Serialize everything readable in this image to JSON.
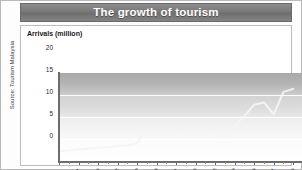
{
  "title": "The growth of tourism",
  "source_note": "Source: Tourism Malaysia",
  "chart_data": {
    "type": "line",
    "title": "The growth of tourism",
    "xlabel": "",
    "ylabel": "Arrivals (million)",
    "ylim": [
      0,
      20
    ],
    "xlim": [
      1981,
      2006
    ],
    "yticks": [
      "0",
      "5",
      "10",
      "15",
      "20"
    ],
    "ytick_values": [
      0,
      5,
      10,
      15,
      20
    ],
    "grid": true,
    "gridlines_at": [
      5,
      10,
      15
    ],
    "legend": "none",
    "xtick_labels": [
      "1981",
      "1983",
      "1985",
      "1987",
      "1989",
      "1991",
      "1993",
      "1995",
      "1997",
      "1999",
      "2001",
      "2003",
      "2005"
    ],
    "x": [
      1981,
      1982,
      1983,
      1984,
      1985,
      1986,
      1987,
      1988,
      1989,
      1990,
      1991,
      1992,
      1993,
      1994,
      1995,
      1996,
      1997,
      1998,
      1999,
      2000,
      2001,
      2002,
      2003,
      2004,
      2005
    ],
    "series": [
      {
        "name": "Arrivals (million)",
        "color": "#f4f4f4",
        "values": [
          2.2,
          2.4,
          2.6,
          2.8,
          3.0,
          3.2,
          3.4,
          3.6,
          4.0,
          7.4,
          6.0,
          6.0,
          6.5,
          7.2,
          7.5,
          7.1,
          6.2,
          5.6,
          7.9,
          10.2,
          12.8,
          13.3,
          10.6,
          15.7,
          16.4
        ]
      }
    ]
  }
}
